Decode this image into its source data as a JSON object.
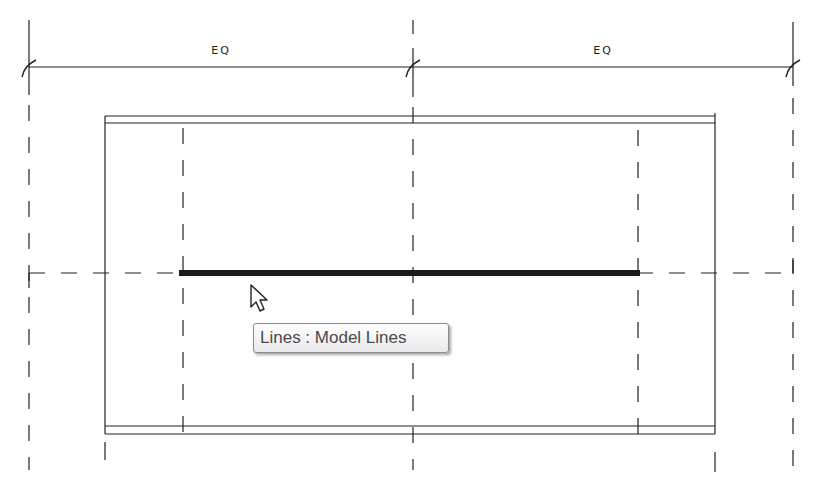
{
  "view": {
    "type": "revit-family-editor-plan",
    "background": "#ffffff",
    "line_color": "#222222"
  },
  "dimensions": {
    "left_label": "EQ",
    "right_label": "EQ"
  },
  "tooltip": {
    "text": "Lines : Model Lines"
  },
  "cursor": {
    "icon": "arrow-pointer-icon"
  }
}
